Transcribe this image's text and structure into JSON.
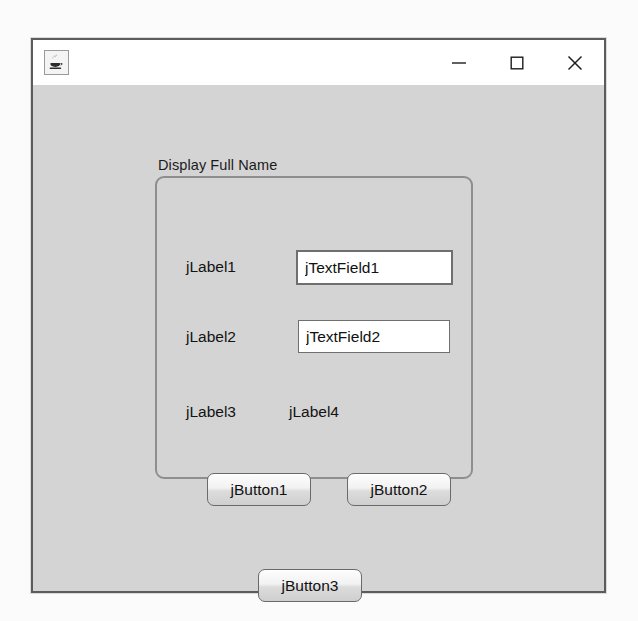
{
  "window": {
    "icon_name": "java-coffee-cup-icon",
    "title": "",
    "controls": {
      "minimize_label": "–",
      "maximize_label": "□",
      "close_label": "✕",
      "minimize_icon": "minimize-icon",
      "maximize_icon": "maximize-icon",
      "close_icon": "close-icon"
    }
  },
  "panel": {
    "title": "Display Full Name"
  },
  "labels": {
    "label1": "jLabel1",
    "label2": "jLabel2",
    "label3": "jLabel3",
    "label4": "jLabel4"
  },
  "text_fields": {
    "field1": {
      "value": "jTextField1",
      "placeholder": ""
    },
    "field2": {
      "value": "jTextField2",
      "placeholder": ""
    }
  },
  "buttons": {
    "button1": "jButton1",
    "button2": "jButton2",
    "button3": "jButton3"
  },
  "colors": {
    "client_background": "#d4d4d4",
    "title_bar_background": "#ffffff",
    "window_border": "#5c5c5c",
    "panel_border": "#8e8e8e",
    "field_background": "#ffffff",
    "text": "#111111"
  }
}
